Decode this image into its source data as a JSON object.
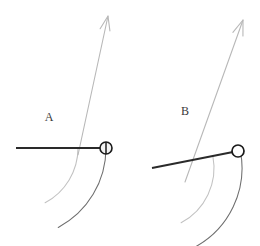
{
  "figure": {
    "width": 260,
    "height": 246,
    "background_color": "#ffffff"
  },
  "colors": {
    "rod": "#2a2a2a",
    "ball_outline": "#1a1a1a",
    "ball_fill_A": "#f2f2f2",
    "ball_fill_B": "#ffffff",
    "arrow": "#b8b8b8",
    "arc_outer": "#6e6e6e",
    "arc_inner": "#c2c2c2",
    "label": "#3a3a3a"
  },
  "panels": [
    {
      "id": "A",
      "label": "A",
      "label_pos": {
        "x": 49,
        "y": 121
      },
      "rod": {
        "name": "rod-a",
        "x1": 16,
        "y1": 148,
        "x2": 100,
        "y2": 148,
        "stroke_width": 2.2
      },
      "ball": {
        "name": "ball-a",
        "cx": 106,
        "cy": 148,
        "r": 6,
        "style": "half-filled",
        "divider": "vertical"
      },
      "arrow": {
        "name": "velocity-arrow-a",
        "x1": 78,
        "y1": 155,
        "x2": 108,
        "y2": 16,
        "head_len": 15,
        "stroke_width": 1.1
      },
      "arc_outer": {
        "name": "arc-outer-a",
        "cx": 16,
        "cy": 148,
        "r": 90,
        "start_deg": 0,
        "end_deg": 62
      },
      "arc_inner": {
        "name": "arc-inner-a",
        "cx": 16,
        "cy": 148,
        "r": 62,
        "start_deg": 0,
        "end_deg": 62
      }
    },
    {
      "id": "B",
      "label": "B",
      "label_pos": {
        "x": 185,
        "y": 115
      },
      "rod": {
        "name": "rod-b",
        "x1": 152,
        "y1": 168,
        "x2": 233,
        "y2": 152,
        "stroke_width": 2.2
      },
      "ball": {
        "name": "ball-b",
        "cx": 238,
        "cy": 151,
        "r": 6,
        "style": "open",
        "divider": "none"
      },
      "arrow": {
        "name": "velocity-arrow-b",
        "x1": 185,
        "y1": 182,
        "x2": 243,
        "y2": 20,
        "head_len": 16,
        "stroke_width": 1.1
      },
      "arc_outer": {
        "name": "arc-outer-b",
        "cx": 152,
        "cy": 168,
        "r": 90,
        "start_deg": -11,
        "end_deg": 62
      },
      "arc_inner": {
        "name": "arc-inner-b",
        "cx": 152,
        "cy": 168,
        "r": 62,
        "start_deg": -11,
        "end_deg": 62
      }
    }
  ]
}
